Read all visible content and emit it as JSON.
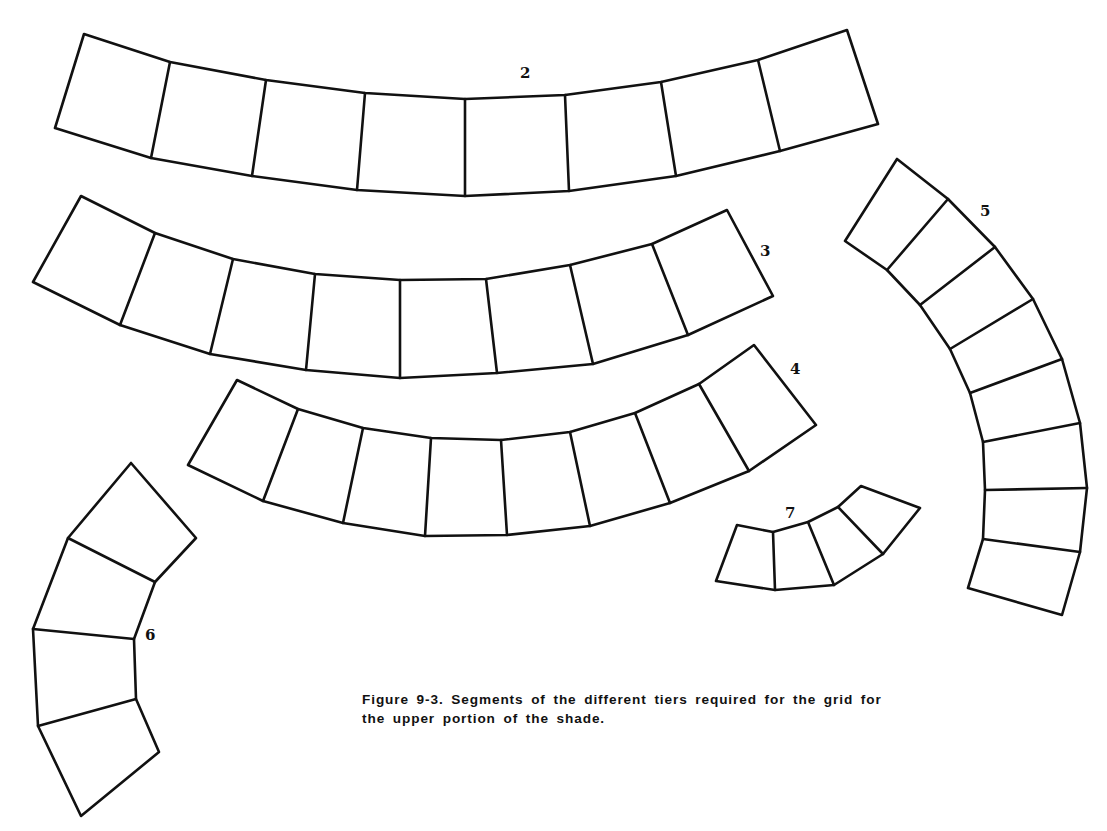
{
  "figure": {
    "caption_line1": "Figure 9-3.  Segments of the different tiers required for the grid for",
    "caption_line2": "the upper portion of the shade.",
    "caption_full": "Figure 9-3. Segments of the different tiers required for the grid for the upper portion of the shade.",
    "stroke_color": "#111111",
    "background_color": "#ffffff"
  },
  "tiers": [
    {
      "label": "2",
      "segments": 8,
      "label_pos": [
        520,
        78
      ],
      "edge_a": [
        [
          84,
          34
        ],
        [
          170,
          62
        ],
        [
          266,
          80
        ],
        [
          365,
          93
        ],
        [
          465,
          99
        ],
        [
          565,
          95
        ],
        [
          661,
          82
        ],
        [
          758,
          60
        ],
        [
          847,
          30
        ]
      ],
      "edge_b": [
        [
          55,
          128
        ],
        [
          151,
          158
        ],
        [
          252,
          176
        ],
        [
          357,
          190
        ],
        [
          465,
          196
        ],
        [
          569,
          191
        ],
        [
          676,
          176
        ],
        [
          780,
          151
        ],
        [
          878,
          124
        ]
      ]
    },
    {
      "label": "3",
      "segments": 8,
      "label_pos": [
        760,
        256
      ],
      "edge_a": [
        [
          81,
          196
        ],
        [
          155,
          233
        ],
        [
          233,
          259
        ],
        [
          315,
          274
        ],
        [
          400,
          280
        ],
        [
          486,
          279
        ],
        [
          570,
          265
        ],
        [
          652,
          244
        ],
        [
          727,
          210
        ]
      ],
      "edge_b": [
        [
          33,
          282
        ],
        [
          120,
          325
        ],
        [
          210,
          354
        ],
        [
          306,
          370
        ],
        [
          400,
          378
        ],
        [
          497,
          373
        ],
        [
          593,
          364
        ],
        [
          688,
          335
        ],
        [
          773,
          296
        ]
      ]
    },
    {
      "label": "4",
      "segments": 8,
      "label_pos": [
        790,
        374
      ],
      "edge_a": [
        [
          237,
          380
        ],
        [
          298,
          409
        ],
        [
          363,
          428
        ],
        [
          431,
          438
        ],
        [
          501,
          440
        ],
        [
          570,
          432
        ],
        [
          635,
          413
        ],
        [
          699,
          384
        ],
        [
          754,
          345
        ]
      ],
      "edge_b": [
        [
          188,
          465
        ],
        [
          263,
          501
        ],
        [
          343,
          523
        ],
        [
          425,
          536
        ],
        [
          507,
          535
        ],
        [
          590,
          526
        ],
        [
          670,
          503
        ],
        [
          749,
          471
        ],
        [
          816,
          425
        ]
      ]
    },
    {
      "label": "5",
      "segments": 8,
      "label_pos": [
        980,
        216
      ],
      "edge_a": [
        [
          845,
          241
        ],
        [
          887,
          270
        ],
        [
          920,
          305
        ],
        [
          950,
          349
        ],
        [
          970,
          393
        ],
        [
          983,
          442
        ],
        [
          985,
          490
        ],
        [
          983,
          539
        ],
        [
          968,
          588
        ]
      ],
      "edge_b": [
        [
          897,
          159
        ],
        [
          948,
          199
        ],
        [
          995,
          247
        ],
        [
          1033,
          299
        ],
        [
          1062,
          359
        ],
        [
          1080,
          423
        ],
        [
          1087,
          488
        ],
        [
          1080,
          552
        ],
        [
          1062,
          615
        ]
      ]
    },
    {
      "label": "6",
      "segments": 4,
      "label_pos": [
        145,
        640
      ],
      "edge_a": [
        [
          131,
          463
        ],
        [
          68,
          538
        ],
        [
          33,
          629
        ],
        [
          38,
          726
        ],
        [
          81,
          816
        ]
      ],
      "edge_b": [
        [
          196,
          538
        ],
        [
          155,
          582
        ],
        [
          134,
          639
        ],
        [
          136,
          699
        ],
        [
          159,
          752
        ]
      ]
    },
    {
      "label": "7",
      "segments": 4,
      "label_pos": [
        785,
        518
      ],
      "edge_a": [
        [
          737,
          525
        ],
        [
          773,
          532
        ],
        [
          808,
          522
        ],
        [
          838,
          507
        ],
        [
          861,
          486
        ]
      ],
      "edge_b": [
        [
          716,
          581
        ],
        [
          775,
          590
        ],
        [
          834,
          585
        ],
        [
          883,
          554
        ],
        [
          920,
          508
        ]
      ]
    }
  ]
}
